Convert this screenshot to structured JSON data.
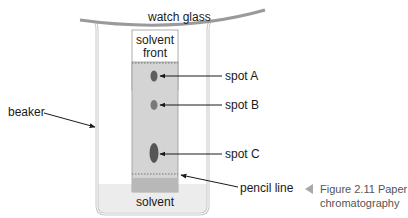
{
  "diagram": {
    "labels": {
      "watch_glass": "watch glass",
      "solvent_front_line1": "solvent",
      "solvent_front_line2": "front",
      "spot_a": "spot A",
      "spot_b": "spot B",
      "spot_c": "spot C",
      "beaker": "beaker",
      "pencil_line": "pencil line",
      "solvent": "solvent"
    },
    "caption": {
      "line1": "Figure 2.11 Paper",
      "line2": "chromatography",
      "marker_icon": "triangle-left-icon"
    },
    "colors": {
      "paper": "#d4d4d4",
      "paper_wet_bottom": "#b8b8b8",
      "spot": "#5e5e5e",
      "beaker_wall": "#c8c8c8",
      "solvent": "#ececec",
      "watch_glass": "#9a9a9a",
      "caption_marker": "#a8a8a8"
    }
  }
}
